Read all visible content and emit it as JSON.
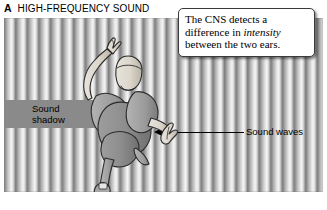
{
  "panel": {
    "letter": "A",
    "title": "HIGH-FREQUENCY SOUND"
  },
  "callout": {
    "text_part1": "The CNS detects a difference in ",
    "text_italic": "intensity",
    "text_part2": " between the two ears."
  },
  "labels": {
    "sound_shadow_line1": "Sound",
    "sound_shadow_line2": "shadow",
    "sound_waves": "Sound waves"
  },
  "icons": {
    "arrow_left": "arrow-left-icon",
    "person": "person-top-down-icon",
    "waves": "sound-wave-stripes-icon"
  },
  "colors": {
    "shadow_bar": "#8a8a8a",
    "wave_dark": "#808080",
    "wave_light": "#f4f4f4",
    "ink": "#000000",
    "callout_bg": "#ffffff"
  }
}
